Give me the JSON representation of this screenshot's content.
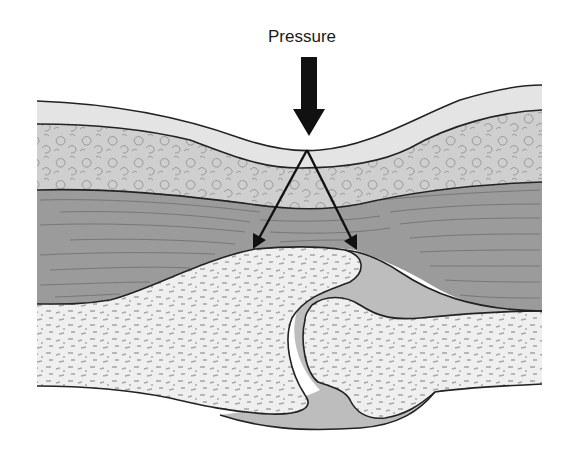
{
  "diagram": {
    "type": "anatomical cross-section",
    "labels": {
      "pressure": "Pressure"
    },
    "layers": [
      {
        "name": "skin",
        "color": "#e4e4e4"
      },
      {
        "name": "subcutaneous-fat",
        "color": "#cfcfcf"
      },
      {
        "name": "muscle",
        "color": "#9b9b9b"
      },
      {
        "name": "bone",
        "color": "#efefef"
      },
      {
        "name": "joint-capsule",
        "color": "#bdbdbd"
      }
    ],
    "colors": {
      "outline": "#222222",
      "arrow": "#111111",
      "fat_texture": "#9a9a9a",
      "muscle_fiber": "#6a6a6a",
      "bone_texture": "#a8a8a8"
    }
  }
}
